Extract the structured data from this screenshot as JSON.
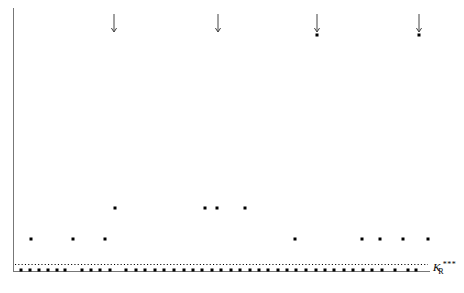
{
  "figure": {
    "background_color": "#ffffff",
    "ink_color": "#000000",
    "axis_color": "#555555"
  },
  "axes": {
    "y_axis": {
      "x": 13,
      "y_top": 8,
      "y_bottom": 272,
      "color": "#777777",
      "width": 1
    },
    "x_axis": {
      "y": 271,
      "x_left": 13,
      "x_right": 430,
      "color": "#777777",
      "width": 1
    },
    "x_tick_labels": [],
    "y_tick_labels": [],
    "grid": "off"
  },
  "reference_line": {
    "label_k": "K",
    "label_sub": "R",
    "label_sup": "***",
    "style": "dotted",
    "y": 264,
    "x_start": 15,
    "x_end": 428,
    "label_x": 433,
    "label_y": 266
  },
  "arrows": {
    "name": "censored-above-marker",
    "glyph": "down-arrow",
    "items": [
      {
        "x": 114,
        "y_top": 14,
        "y_bottom": 32
      },
      {
        "x": 218,
        "y_top": 14,
        "y_bottom": 32
      },
      {
        "x": 317,
        "y_top": 14,
        "y_bottom": 32
      },
      {
        "x": 419,
        "y_top": 14,
        "y_bottom": 32
      }
    ]
  },
  "chart_data": {
    "type": "scatter",
    "title": "",
    "xlabel": "",
    "ylabel": "",
    "xlim": [
      13,
      430
    ],
    "ylim": [
      8,
      272
    ],
    "grid": "off",
    "legend": "none",
    "annotations": [
      {
        "type": "reference-line",
        "style": "dotted",
        "label": "K_R^***",
        "y_px": 264
      },
      {
        "type": "down-arrow",
        "x_px": 114
      },
      {
        "type": "down-arrow",
        "x_px": 218
      },
      {
        "type": "down-arrow",
        "x_px": 317
      },
      {
        "type": "down-arrow",
        "x_px": 419
      }
    ],
    "series": [
      {
        "name": "arrow-capped-points",
        "marker": "square",
        "points": [
          {
            "x": 317,
            "y": 35
          },
          {
            "x": 419,
            "y": 35
          }
        ]
      },
      {
        "name": "upper-band-points",
        "marker": "square",
        "points": [
          {
            "x": 115,
            "y": 208
          },
          {
            "x": 205,
            "y": 208
          },
          {
            "x": 217,
            "y": 208
          },
          {
            "x": 245,
            "y": 208
          },
          {
            "x": 295,
            "y": 239
          }
        ]
      },
      {
        "name": "mid-band-points",
        "marker": "square",
        "points": [
          {
            "x": 31,
            "y": 239
          },
          {
            "x": 73,
            "y": 239
          },
          {
            "x": 105,
            "y": 239
          },
          {
            "x": 362,
            "y": 239
          },
          {
            "x": 380,
            "y": 239
          },
          {
            "x": 403,
            "y": 239
          },
          {
            "x": 428,
            "y": 239
          }
        ]
      },
      {
        "name": "baseline-points",
        "marker": "square",
        "points": [
          {
            "x": 21,
            "y": 270
          },
          {
            "x": 30,
            "y": 270
          },
          {
            "x": 39,
            "y": 270
          },
          {
            "x": 48,
            "y": 270
          },
          {
            "x": 57,
            "y": 270
          },
          {
            "x": 65,
            "y": 270
          },
          {
            "x": 82,
            "y": 270
          },
          {
            "x": 91,
            "y": 270
          },
          {
            "x": 100,
            "y": 270
          },
          {
            "x": 110,
            "y": 270
          },
          {
            "x": 126,
            "y": 270
          },
          {
            "x": 136,
            "y": 270
          },
          {
            "x": 145,
            "y": 270
          },
          {
            "x": 155,
            "y": 270
          },
          {
            "x": 164,
            "y": 270
          },
          {
            "x": 174,
            "y": 270
          },
          {
            "x": 184,
            "y": 270
          },
          {
            "x": 193,
            "y": 270
          },
          {
            "x": 202,
            "y": 270
          },
          {
            "x": 212,
            "y": 270
          },
          {
            "x": 221,
            "y": 270
          },
          {
            "x": 231,
            "y": 270
          },
          {
            "x": 240,
            "y": 270
          },
          {
            "x": 250,
            "y": 270
          },
          {
            "x": 259,
            "y": 270
          },
          {
            "x": 268,
            "y": 270
          },
          {
            "x": 278,
            "y": 270
          },
          {
            "x": 287,
            "y": 270
          },
          {
            "x": 296,
            "y": 270
          },
          {
            "x": 306,
            "y": 270
          },
          {
            "x": 316,
            "y": 270
          },
          {
            "x": 325,
            "y": 270
          },
          {
            "x": 334,
            "y": 270
          },
          {
            "x": 344,
            "y": 270
          },
          {
            "x": 353,
            "y": 270
          },
          {
            "x": 363,
            "y": 270
          },
          {
            "x": 372,
            "y": 270
          },
          {
            "x": 382,
            "y": 270
          },
          {
            "x": 395,
            "y": 270
          },
          {
            "x": 408,
            "y": 270
          },
          {
            "x": 416,
            "y": 270
          }
        ]
      }
    ]
  }
}
